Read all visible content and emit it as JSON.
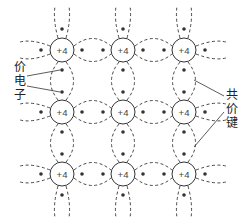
{
  "diagram": {
    "atom_charge": "+4",
    "grid": {
      "cols": [
        62,
        123,
        184
      ],
      "rows": [
        50,
        112,
        174
      ],
      "radius": 12
    },
    "colors": {
      "line": "#333333",
      "bg": "#ffffff"
    },
    "labels": {
      "valence_electron": [
        "价",
        "电",
        "子"
      ],
      "covalent_bond": [
        "共",
        "价",
        "键"
      ]
    }
  }
}
